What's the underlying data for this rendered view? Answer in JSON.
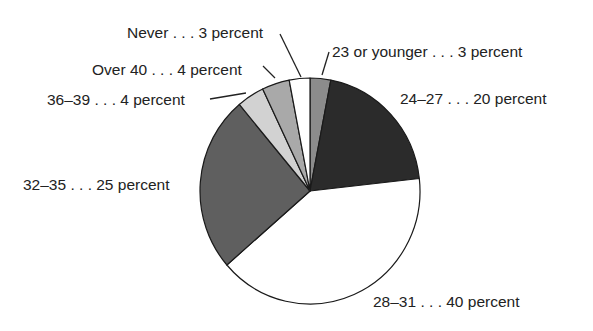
{
  "chart_data": {
    "type": "pie",
    "title": "",
    "start_angle_deg": 0,
    "direction": "clockwise",
    "slices": [
      {
        "label": "23 or younger",
        "value": 3,
        "display": "23 or younger . . . 3 percent",
        "color": "#8c8c8c"
      },
      {
        "label": "24–27",
        "value": 20,
        "display": "24–27 . . . 20 percent",
        "color": "#2b2b2b"
      },
      {
        "label": "28–31",
        "value": 40,
        "display": "28–31 . . . 40 percent",
        "color": "#ffffff"
      },
      {
        "label": "32–35",
        "value": 25,
        "display": "32–35 . . . 25 percent",
        "color": "#5f5f5f"
      },
      {
        "label": "36–39",
        "value": 4,
        "display": "36–39 . . . 4 percent",
        "color": "#d2d2d2"
      },
      {
        "label": "Over 40",
        "value": 4,
        "display": "Over 40 . . . 4 percent",
        "color": "#a9a9a9"
      },
      {
        "label": "Never",
        "value": 3,
        "display": "Never . . . 3 percent",
        "color": "#ffffff"
      }
    ],
    "categories": [
      "23 or younger",
      "24–27",
      "28–31",
      "32–35",
      "36–39",
      "Over 40",
      "Never"
    ],
    "values": [
      3,
      20,
      40,
      25,
      4,
      4,
      3
    ],
    "unit": "percent",
    "legend": "none (direct labels with leader lines)"
  },
  "labels": {
    "never": "Never . . . 3 percent",
    "under23": "23 or younger . . . 3 percent",
    "over40": "Over 40 . . . 4 percent",
    "age24_27": "24–27 . . . 20 percent",
    "age36_39": "36–39 . . . 4 percent",
    "age32_35": "32–35 . . . 25 percent",
    "age28_31": "28–31 . . . 40 percent"
  },
  "geometry": {
    "cx": 310,
    "cy": 191,
    "rx": 110,
    "ry": 113
  }
}
